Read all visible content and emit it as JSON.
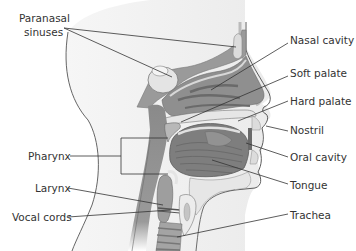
{
  "diagram": {
    "labels": {
      "paranasal_line1": "Paranasal",
      "paranasal_line2": "sinuses",
      "nasal_cavity": "Nasal cavity",
      "soft_palate": "Soft palate",
      "hard_palate": "Hard palate",
      "nostril": "Nostril",
      "oral_cavity": "Oral cavity",
      "tongue": "Tongue",
      "trachea": "Trachea",
      "pharynx": "Pharynx",
      "larynx": "Larynx",
      "vocal_cords": "Vocal cords"
    },
    "colors": {
      "skin": "#f2f2f2",
      "dark_tissue": "#8a8a8a",
      "mid_tissue": "#a8a8a8",
      "light_tissue": "#d4d4d4",
      "bone": "#e8e8e8",
      "outline": "#4a4a4a",
      "label_text": "#333333"
    }
  }
}
